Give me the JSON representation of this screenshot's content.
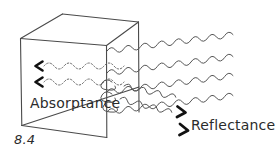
{
  "figure": {
    "number": "8.4",
    "labels": {
      "absorptance": "Absorptance",
      "reflectance": "Reflectance"
    },
    "colors": {
      "ink": "#2b2b2b",
      "line": "#4a4a4a",
      "wave": "#555555",
      "arrow": "#111111",
      "background": "#ffffff"
    },
    "elements": {
      "cube_name": "sketched-cube",
      "absorbed_waves_count": 2,
      "transmitted_waves_count": 4,
      "reflected_waves_count": 2,
      "absorbed_wave_style": "dotted",
      "transmitted_wave_style": "solid",
      "reflected_wave_style": "solid",
      "absorbed_arrow_direction": "left",
      "reflected_arrow_direction": "right-down"
    }
  }
}
